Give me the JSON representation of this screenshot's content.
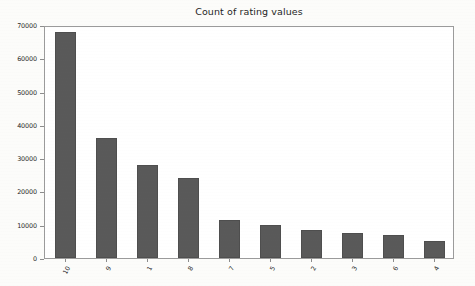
{
  "chart_data": {
    "type": "bar",
    "title": "Count of rating values",
    "xlabel": "",
    "ylabel": "",
    "categories": [
      "10",
      "9",
      "1",
      "8",
      "7",
      "5",
      "2",
      "3",
      "6",
      "4"
    ],
    "values": [
      68000,
      36000,
      28000,
      24000,
      11500,
      10000,
      8300,
      7400,
      6900,
      5100
    ],
    "ylim": [
      0,
      70000
    ],
    "yticks": [
      0,
      10000,
      20000,
      30000,
      40000,
      50000,
      60000,
      70000
    ],
    "ytick_labels": [
      "0",
      "10000",
      "20000",
      "30000",
      "40000",
      "50000",
      "60000",
      "70000"
    ],
    "grid": false,
    "legend": false,
    "bar_color": "#595959",
    "frame_color": "#9b9b9b",
    "plot_background": "#ffffff",
    "figure_background": "#fcfcfa",
    "xtick_rotation": -62
  }
}
